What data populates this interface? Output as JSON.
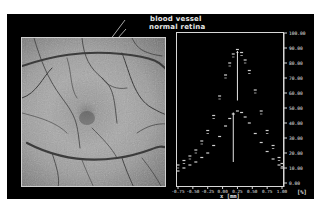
{
  "figure": {
    "annotations": [
      {
        "id": "blood_vessel",
        "text": "blood vessel"
      },
      {
        "id": "normal_retina",
        "text": "normal retina"
      }
    ]
  },
  "chart_data": {
    "type": "scatter",
    "title": "",
    "xlabel": "x [mm]",
    "ylabel": "[%]",
    "xlim": [
      -0.75,
      1.0
    ],
    "ylim": [
      0,
      100
    ],
    "x_ticks": [
      "-0.75",
      "-0.50",
      "-0.25",
      "0.00",
      "0.25",
      "0.50",
      "0.75",
      "1.00"
    ],
    "y_ticks": [
      "0.00",
      "10.00",
      "20.00",
      "30.00",
      "40.00",
      "50.00",
      "60.00",
      "70.00",
      "80.00",
      "90.00",
      "100.00"
    ],
    "y_axis_position": "right",
    "grid": false,
    "series": [
      {
        "name": "normal retina",
        "x": [
          -0.75,
          -0.65,
          -0.55,
          -0.45,
          -0.35,
          -0.25,
          -0.15,
          -0.05,
          0.05,
          0.12,
          0.18,
          0.25,
          0.32,
          0.38,
          0.45,
          0.55,
          0.65,
          0.75,
          0.85,
          0.95,
          1.0
        ],
        "values": [
          12,
          15,
          18,
          22,
          28,
          35,
          45,
          58,
          72,
          80,
          86,
          89,
          87,
          82,
          75,
          62,
          48,
          35,
          25,
          17,
          13
        ],
        "peak_marker": {
          "x": 0.25,
          "y_top": 88,
          "y_bottom": 55
        }
      },
      {
        "name": "blood vessel",
        "x": [
          -0.75,
          -0.65,
          -0.55,
          -0.45,
          -0.35,
          -0.25,
          -0.15,
          -0.05,
          0.05,
          0.12,
          0.18,
          0.25,
          0.32,
          0.38,
          0.45,
          0.55,
          0.65,
          0.75,
          0.85,
          0.95,
          1.0
        ],
        "values": [
          8,
          10,
          12,
          14,
          17,
          20,
          25,
          31,
          38,
          43,
          46,
          48,
          47,
          44,
          40,
          33,
          27,
          21,
          16,
          12,
          10
        ],
        "peak_marker": {
          "x": 0.18,
          "y_top": 47,
          "y_bottom": 14
        }
      }
    ]
  }
}
